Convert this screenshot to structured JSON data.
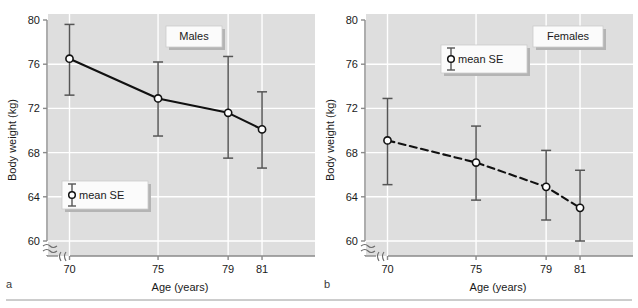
{
  "figure": {
    "background": "#ffffff",
    "plot_background": "#dedede",
    "gridline_color": "#ffffff",
    "axis_color": "#8a8a8a",
    "series_color": "#111111",
    "errorbar_color": "#555555",
    "divider_color": "#9a9a9a"
  },
  "panels": [
    {
      "letter": "a",
      "box_label": "Males",
      "legend_label": "mean SE"
    },
    {
      "letter": "b",
      "box_label": "Females",
      "legend_label": "mean SE"
    }
  ],
  "chart_data": [
    {
      "type": "line",
      "title": "Males",
      "panel": "a",
      "xlabel": "Age (years)",
      "ylabel": "Body weight (kg)",
      "categories": [
        70,
        75,
        79,
        81
      ],
      "xtick_labels": [
        "70",
        "75",
        "79",
        "81"
      ],
      "ytick_labels": [
        "60",
        "64",
        "68",
        "72",
        "76",
        "80"
      ],
      "yticks": [
        60,
        64,
        68,
        72,
        76,
        80
      ],
      "ylim": [
        59.0,
        80.0
      ],
      "xlim": [
        69.2,
        82.2
      ],
      "axis_break_x": true,
      "axis_break_y": true,
      "grid": true,
      "line_style": "solid",
      "marker": "open-circle",
      "values": [
        76.5,
        72.9,
        71.6,
        70.1
      ],
      "err_low": [
        73.2,
        69.5,
        67.5,
        66.6
      ],
      "err_high": [
        79.6,
        76.2,
        76.7,
        73.5
      ],
      "legend": "mean SE",
      "legend_position": "lower-left"
    },
    {
      "type": "line",
      "title": "Females",
      "panel": "b",
      "xlabel": "Age (years)",
      "ylabel": "Body weight (kg)",
      "categories": [
        70,
        75,
        79,
        81
      ],
      "xtick_labels": [
        "70",
        "75",
        "79",
        "81"
      ],
      "ytick_labels": [
        "60",
        "64",
        "68",
        "72",
        "76",
        "80"
      ],
      "yticks": [
        60,
        64,
        68,
        72,
        76,
        80
      ],
      "ylim": [
        59.0,
        80.0
      ],
      "xlim": [
        69.2,
        82.2
      ],
      "axis_break_x": true,
      "axis_break_y": true,
      "grid": true,
      "line_style": "dashed",
      "marker": "open-circle",
      "values": [
        69.1,
        67.1,
        64.9,
        63.0
      ],
      "err_low": [
        65.1,
        63.7,
        61.9,
        60.0
      ],
      "err_high": [
        72.9,
        70.4,
        68.2,
        66.4
      ],
      "legend": "mean SE",
      "legend_position": "upper-center"
    }
  ],
  "axes": {
    "x_title": "Age (years)",
    "y_title": "Body weight (kg)"
  }
}
